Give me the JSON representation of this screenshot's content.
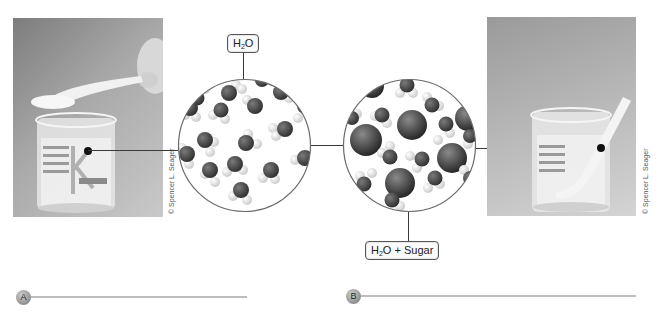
{
  "figure": {
    "left_panel": {
      "photo_description": "Beaker of water with a spoon of sugar held above it",
      "photo_credit": "© Spencer L. Seager",
      "molecular_view_label": "H2O",
      "molecular_view_label_parts": {
        "main": "H",
        "sub": "2",
        "tail": "O"
      }
    },
    "right_panel": {
      "photo_description": "Beaker of sugar water with a stirring rod",
      "photo_credit": "© Spencer L. Seager",
      "molecular_view_label": "H2O + Sugar",
      "molecular_view_label_parts": {
        "main": "H",
        "sub": "2",
        "tail": "O + Sugar"
      }
    },
    "section_markers": [
      {
        "letter": "A"
      },
      {
        "letter": "B"
      }
    ],
    "colors": {
      "line": "#3a3a3a",
      "rule": "#bdbdbd",
      "molecule_dark": "#4a4a4a",
      "molecule_light": "#efefef"
    }
  }
}
